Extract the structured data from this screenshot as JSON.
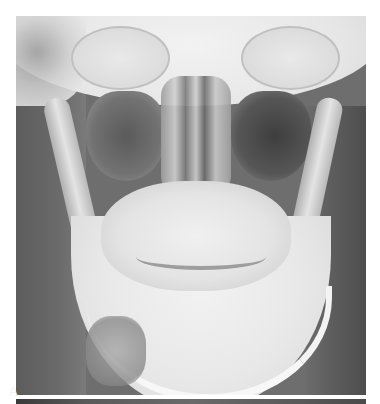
{
  "figure": {
    "type": "radiograph",
    "panels": [
      {
        "label": "A",
        "position": "bottom-left"
      }
    ],
    "colors": {
      "background": "#ffffff",
      "label_text": "#f4f4f4",
      "soft_tissue": "#6e6e6e",
      "bone": "#e8e8e8"
    }
  }
}
